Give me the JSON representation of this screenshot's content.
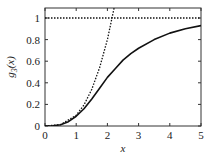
{
  "chart_data": {
    "type": "line",
    "title": "",
    "xlabel": "x",
    "ylabel": "g3(x)",
    "ylabel_main": "g",
    "ylabel_sub": "3",
    "ylabel_arg": "(x)",
    "xlim": [
      0,
      5
    ],
    "ylim": [
      0,
      1.1
    ],
    "grid": false,
    "legend": null,
    "x_ticks": [
      0,
      1,
      2,
      3,
      4,
      5
    ],
    "x_tick_labels": [
      "0",
      "1",
      "2",
      "3",
      "4",
      "5"
    ],
    "y_ticks": [
      0,
      0.2,
      0.4,
      0.6,
      0.8,
      1
    ],
    "y_tick_labels": [
      "0",
      "0.2",
      "0.4",
      "0.6",
      "0.8",
      "1"
    ],
    "series": [
      {
        "name": "g3(x)",
        "style": "solid",
        "x": [
          0,
          0.25,
          0.5,
          0.75,
          1.0,
          1.25,
          1.5,
          1.75,
          2.0,
          2.25,
          2.5,
          2.75,
          3.0,
          3.5,
          4.0,
          4.5,
          5.0
        ],
        "values": [
          0,
          0.002,
          0.012,
          0.04,
          0.09,
          0.16,
          0.25,
          0.35,
          0.45,
          0.53,
          0.61,
          0.67,
          0.72,
          0.8,
          0.86,
          0.9,
          0.93
        ]
      },
      {
        "name": "small-x asymptote",
        "style": "dotted",
        "x": [
          0,
          0.5,
          1.0,
          1.25,
          1.5,
          1.75,
          2.0,
          2.25
        ],
        "values": [
          0,
          0.0125,
          0.1,
          0.195,
          0.34,
          0.54,
          0.8,
          1.14
        ]
      },
      {
        "name": "large-x asymptote",
        "style": "dotted",
        "x": [
          0,
          5
        ],
        "values": [
          1,
          1
        ]
      }
    ]
  }
}
